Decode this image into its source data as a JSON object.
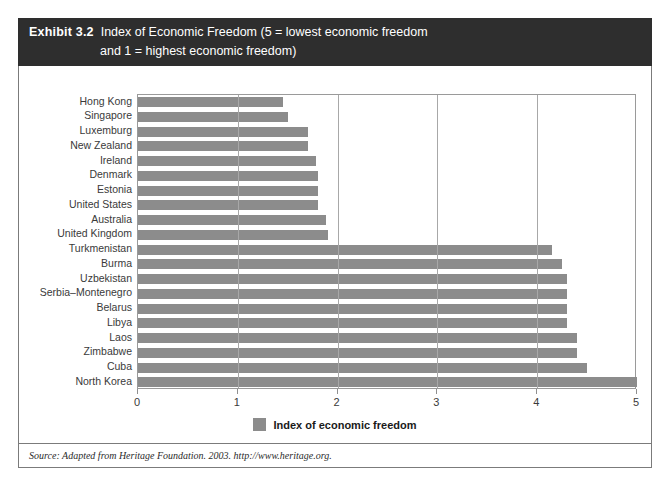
{
  "exhibit": {
    "number": "Exhibit 3.2",
    "title_line1": "Index of Economic Freedom (5 = lowest economic freedom",
    "title_line2": "and 1 = highest economic freedom)"
  },
  "source": {
    "text": "Source: Adapted from Heritage Foundation. 2003. http://www.heritage.org."
  },
  "legend": {
    "label": "Index of economic freedom",
    "swatch_color": "#8c8c8c"
  },
  "colors": {
    "bar": "#8c8c8c",
    "title_band": "#2e2e2e",
    "title_text": "#ffffff",
    "frame": "#7b7b7b",
    "gridline": "#a8a8a8",
    "axis_text": "#3a3a3a"
  },
  "chart_data": {
    "type": "bar",
    "orientation": "horizontal",
    "title": "Index of Economic Freedom (5 = lowest economic freedom and 1 = highest economic freedom)",
    "xlabel": "",
    "ylabel": "",
    "xlim": [
      0,
      5
    ],
    "xticks": [
      0,
      1,
      2,
      3,
      4,
      5
    ],
    "xtick_labels": [
      "0",
      "1",
      "2",
      "3",
      "4",
      "5"
    ],
    "grid": "vertical gridlines at x = 1, 2, 3, 4",
    "legend_position": "bottom-center",
    "series_name": "Index of economic freedom",
    "categories": [
      "Hong Kong",
      "Singapore",
      "Luxemburg",
      "New Zealand",
      "Ireland",
      "Denmark",
      "Estonia",
      "United States",
      "Australia",
      "United Kingdom",
      "Turkmenistan",
      "Burma",
      "Uzbekistan",
      "Serbia–Montenegro",
      "Belarus",
      "Libya",
      "Laos",
      "Zimbabwe",
      "Cuba",
      "North Korea"
    ],
    "values": [
      1.45,
      1.5,
      1.7,
      1.7,
      1.78,
      1.8,
      1.8,
      1.8,
      1.88,
      1.9,
      4.15,
      4.25,
      4.3,
      4.3,
      4.3,
      4.3,
      4.4,
      4.4,
      4.5,
      5.0
    ]
  }
}
